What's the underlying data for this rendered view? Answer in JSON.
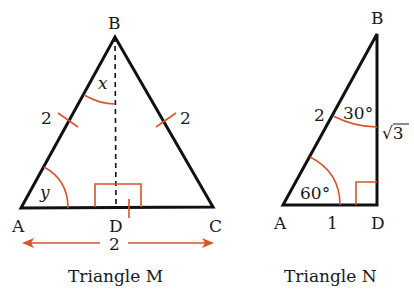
{
  "colors": {
    "line": "#111111",
    "accent": "#d9532b"
  },
  "triangle_m": {
    "caption": "Triangle M",
    "vertices": {
      "A": "A",
      "B": "B",
      "C": "C",
      "D": "D"
    },
    "side_ab": "2",
    "side_bc": "2",
    "base_ac": "2",
    "angle_top": "x",
    "angle_left": "y"
  },
  "triangle_n": {
    "caption": "Triangle N",
    "vertices": {
      "A": "A",
      "B": "B",
      "D": "D"
    },
    "side_ab": "2",
    "side_bd": "√3",
    "side_ad": "1",
    "angle_b": "30°",
    "angle_a": "60°"
  }
}
